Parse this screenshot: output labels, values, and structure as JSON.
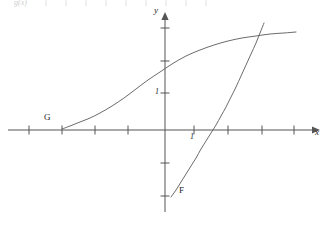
{
  "figure": {
    "width": 330,
    "height": 228,
    "background": "#ffffff",
    "stroke_color": "#5a5a5a",
    "axis_color": "#555555",
    "text_color": "#262626"
  },
  "top_strip": {
    "clipped_label": "g(x)",
    "visible": true,
    "note": "partially cropped header row of tick marks at very top edge"
  },
  "axes": {
    "origin": {
      "x": 165,
      "y": 130
    },
    "x_axis": {
      "label": "x",
      "label_pos": {
        "x": 317,
        "y": 133
      },
      "start": {
        "x": 8,
        "y": 130
      },
      "end": {
        "x": 318,
        "y": 130
      },
      "arrow": "right",
      "tick_spacing": 33,
      "ticks": [
        29,
        62,
        95,
        128,
        194,
        228,
        262,
        294
      ],
      "tick_labels": [
        {
          "text": "1",
          "x": 191,
          "y": 134
        }
      ]
    },
    "y_axis": {
      "label": "y",
      "label_pos": {
        "x": 158,
        "y": 10
      },
      "start": {
        "x": 165,
        "y": 212
      },
      "end": {
        "x": 165,
        "y": 14
      },
      "arrow": "up",
      "tick_spacing": 33,
      "ticks": [
        28,
        61,
        93,
        163,
        196
      ],
      "tick_labels": [
        {
          "text": "1",
          "x": 156,
          "y": 90
        }
      ]
    }
  },
  "chart_data": {
    "type": "line",
    "title": "",
    "xlabel": "x",
    "ylabel": "y",
    "grid": false,
    "legend": "inline-curve-labels",
    "xlim": [
      -4.8,
      4.7
    ],
    "ylim": [
      -3.5,
      3.5
    ],
    "annotations": [
      {
        "text": "G",
        "x": 47,
        "y": 118,
        "describes": "logarithmic curve label"
      },
      {
        "text": "F",
        "x": 181,
        "y": 191,
        "describes": "exponential curve label"
      },
      {
        "text": "1",
        "x": 191,
        "y": 134,
        "describes": "x-axis unit tick label"
      },
      {
        "text": "1",
        "x": 156,
        "y": 90,
        "describes": "y-axis unit tick label"
      }
    ],
    "series": [
      {
        "name": "G",
        "label": "G",
        "style": "solid",
        "description": "increasing concave-then-concave-down logarithm-like curve passing above the x-axis on the left and flattening to the right",
        "points_px": [
          [
            62,
            129
          ],
          [
            70,
            126
          ],
          [
            80,
            122
          ],
          [
            90,
            118
          ],
          [
            100,
            113
          ],
          [
            112,
            106
          ],
          [
            124,
            98
          ],
          [
            136,
            89
          ],
          [
            148,
            80
          ],
          [
            160,
            72
          ],
          [
            172,
            64
          ],
          [
            186,
            56
          ],
          [
            200,
            50
          ],
          [
            214,
            45
          ],
          [
            228,
            41
          ],
          [
            242,
            38
          ],
          [
            256,
            36
          ],
          [
            270,
            34
          ],
          [
            284,
            33
          ],
          [
            296,
            32
          ]
        ],
        "points_data": [
          [
            -3.1,
            0.0
          ],
          [
            -2.9,
            0.1
          ],
          [
            -2.6,
            0.25
          ],
          [
            -2.3,
            0.36
          ],
          [
            -2.0,
            0.5
          ],
          [
            -1.6,
            0.7
          ],
          [
            -1.25,
            0.95
          ],
          [
            -0.9,
            1.25
          ],
          [
            -0.5,
            1.5
          ],
          [
            -0.15,
            1.75
          ],
          [
            0.2,
            2.0
          ],
          [
            0.65,
            2.25
          ],
          [
            1.05,
            2.4
          ],
          [
            1.5,
            2.6
          ],
          [
            1.9,
            2.7
          ],
          [
            2.35,
            2.8
          ],
          [
            2.75,
            2.85
          ],
          [
            3.2,
            2.9
          ],
          [
            3.6,
            2.95
          ],
          [
            4.0,
            3.0
          ]
        ]
      },
      {
        "name": "F",
        "label": "F",
        "style": "solid",
        "description": "increasing exponential-like curve rising steeply to the right, crossing the x-axis near x=1.7",
        "points_px": [
          [
            171,
            197
          ],
          [
            176,
            190
          ],
          [
            181,
            182
          ],
          [
            186,
            174
          ],
          [
            191,
            166
          ],
          [
            196,
            158
          ],
          [
            201,
            149
          ],
          [
            206,
            141
          ],
          [
            211,
            133
          ],
          [
            216,
            125
          ],
          [
            221,
            116
          ],
          [
            226,
            107
          ],
          [
            231,
            97
          ],
          [
            236,
            87
          ],
          [
            241,
            76
          ],
          [
            246,
            65
          ],
          [
            251,
            54
          ],
          [
            256,
            43
          ],
          [
            260,
            33
          ],
          [
            264,
            23
          ]
        ],
        "points_data": [
          [
            0.2,
            -2.05
          ],
          [
            0.35,
            -1.8
          ],
          [
            0.5,
            -1.6
          ],
          [
            0.65,
            -1.35
          ],
          [
            0.8,
            -1.1
          ],
          [
            0.95,
            -0.85
          ],
          [
            1.1,
            -0.6
          ],
          [
            1.25,
            -0.35
          ],
          [
            1.4,
            -0.1
          ],
          [
            1.55,
            0.15
          ],
          [
            1.7,
            0.4
          ],
          [
            1.85,
            0.7
          ],
          [
            2.0,
            1.0
          ],
          [
            2.15,
            1.3
          ],
          [
            2.3,
            1.65
          ],
          [
            2.45,
            2.0
          ],
          [
            2.6,
            2.3
          ],
          [
            2.75,
            2.65
          ],
          [
            2.9,
            2.95
          ],
          [
            3.0,
            3.25
          ]
        ]
      }
    ],
    "intersection_px": [
      262,
      36
    ]
  }
}
